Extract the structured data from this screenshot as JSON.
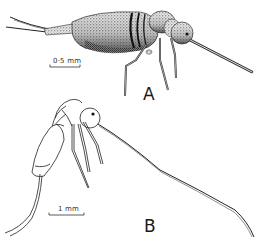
{
  "figure": {
    "panels": [
      {
        "id": "A",
        "label": "A",
        "style": "stippled",
        "scale_bar": {
          "text": "0·5 mm"
        }
      },
      {
        "id": "B",
        "label": "B",
        "style": "line drawing",
        "scale_bar": {
          "text": "1 mm"
        }
      }
    ]
  },
  "colors": {
    "ink": "#1a1a1a",
    "background": "#ffffff"
  }
}
